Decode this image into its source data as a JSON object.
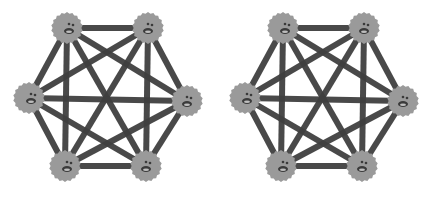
{
  "diagram": {
    "type": "complete-graph",
    "colors": {
      "edge": "#3f3f3f",
      "node": "#9a9a9a",
      "face_feature": "#3a3a3a",
      "background": "#ffffff"
    },
    "panels": [
      {
        "id": "left",
        "offset_x": 0,
        "nodes": [
          {
            "id": "top-left",
            "x": 67,
            "y": 28
          },
          {
            "id": "top-right",
            "x": 148,
            "y": 28
          },
          {
            "id": "left",
            "x": 29,
            "y": 98
          },
          {
            "id": "right",
            "x": 187,
            "y": 101
          },
          {
            "id": "bottom-left",
            "x": 65,
            "y": 166
          },
          {
            "id": "bottom-right",
            "x": 146,
            "y": 166
          }
        ]
      },
      {
        "id": "right",
        "offset_x": 216,
        "nodes": [
          {
            "id": "top-left",
            "x": 67,
            "y": 28
          },
          {
            "id": "top-right",
            "x": 148,
            "y": 28
          },
          {
            "id": "left",
            "x": 29,
            "y": 98
          },
          {
            "id": "right",
            "x": 187,
            "y": 101
          },
          {
            "id": "bottom-left",
            "x": 65,
            "y": 166
          },
          {
            "id": "bottom-right",
            "x": 146,
            "y": 166
          }
        ]
      }
    ],
    "node_radius": 15,
    "edge_width": 6
  }
}
